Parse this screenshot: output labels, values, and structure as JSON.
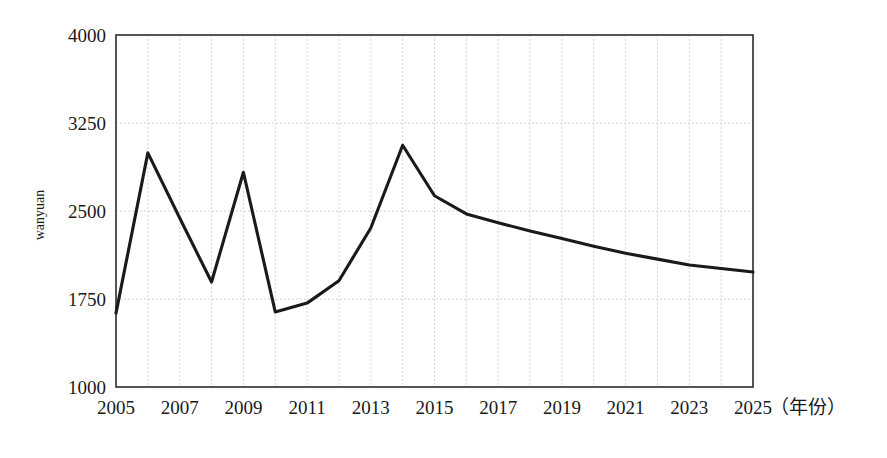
{
  "chart_data": {
    "type": "line",
    "title": "",
    "subtitle": "",
    "xlabel": "（年份）",
    "ylabel": "wanyuan",
    "x": [
      2005,
      2006,
      2007,
      2008,
      2009,
      2010,
      2011,
      2012,
      2013,
      2014,
      2015,
      2016,
      2017,
      2018,
      2019,
      2020,
      2021,
      2022,
      2023,
      2024,
      2025
    ],
    "values": [
      1630,
      2995,
      2440,
      1895,
      2830,
      1640,
      1715,
      1905,
      2355,
      3060,
      2630,
      2475,
      2400,
      2330,
      2265,
      2200,
      2140,
      2090,
      2040,
      2010,
      1980
    ],
    "series": [
      {
        "name": "wanyuan",
        "values": [
          1630,
          2995,
          2440,
          1895,
          2830,
          1640,
          1715,
          1905,
          2355,
          3060,
          2630,
          2475,
          2400,
          2330,
          2265,
          2200,
          2140,
          2090,
          2040,
          2010,
          1980
        ]
      }
    ],
    "xlim": [
      2005,
      2025
    ],
    "ylim": [
      1000,
      4000
    ],
    "y_ticks": [
      1000,
      1750,
      2500,
      3250,
      4000
    ],
    "y_tick_labels": [
      "1000",
      "1750",
      "2500",
      "3250",
      "4000"
    ],
    "x_ticks": [
      2005,
      2007,
      2009,
      2011,
      2013,
      2015,
      2017,
      2019,
      2021,
      2023,
      2025
    ],
    "x_tick_labels": [
      "2005",
      "2007",
      "2009",
      "2011",
      "2013",
      "2015",
      "2017",
      "2019",
      "2021",
      "2023",
      "2025"
    ],
    "x_minor_step": 1,
    "grid": {
      "vertical": true,
      "horizontal": true,
      "style": "dotted",
      "color": "#c9c9c9"
    },
    "legend": {
      "visible": false,
      "position": "none",
      "entries": []
    },
    "line_color": "#1a1a1a",
    "background_color": "#ffffff",
    "markers": false,
    "annotations": []
  },
  "axis": {
    "y_title": "wanyuan",
    "x_unit_label": "（年份）"
  }
}
